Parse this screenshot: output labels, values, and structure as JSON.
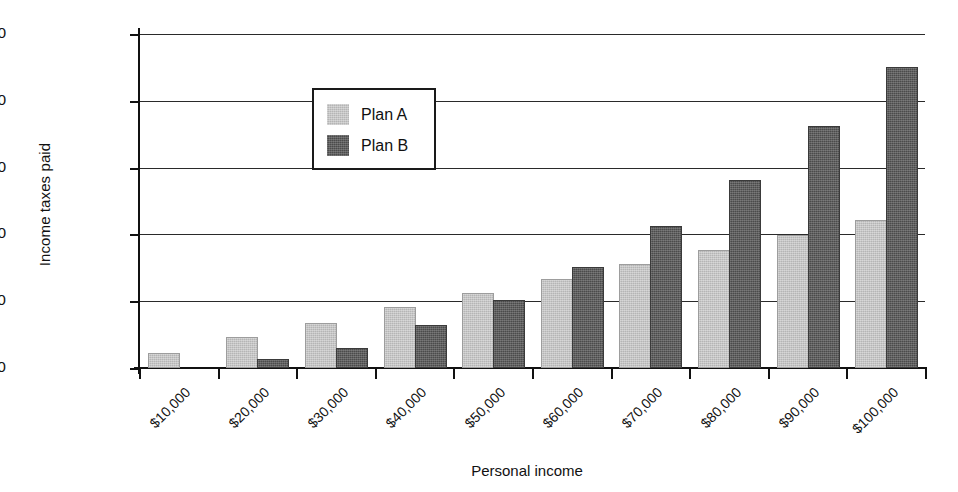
{
  "chart_data": {
    "type": "bar",
    "title": "",
    "xlabel": "Personal income",
    "ylabel": "Income taxes paid",
    "categories": [
      "$10,000",
      "$20,000",
      "$30,000",
      "$40,000",
      "$50,000",
      "$60,000",
      "$70,000",
      "$80,000",
      "$90,000",
      "$100,000"
    ],
    "series": [
      {
        "name": "Plan A",
        "color": "#b5b5b5",
        "values": [
          1000,
          2200,
          3200,
          4450,
          5450,
          6500,
          7600,
          8700,
          9800,
          10950
        ]
      },
      {
        "name": "Plan B",
        "color": "#4b4b4b",
        "values": [
          0,
          550,
          1350,
          3050,
          4950,
          7400,
          10450,
          13950,
          17950,
          22400
        ]
      }
    ],
    "ylim": [
      0,
      25000
    ],
    "ytick_values": [
      0,
      5000,
      10000,
      15000,
      20000,
      25000
    ],
    "ytick_labels": [
      "$0",
      "$5,000",
      "$10,000",
      "$15,000",
      "$20,000",
      "$25,000"
    ],
    "grid": "horizontal",
    "legend_position": "upper-left-inside"
  },
  "legend": {
    "entries": [
      {
        "label": "Plan A"
      },
      {
        "label": "Plan B"
      }
    ]
  },
  "axes": {
    "y_title": "Income taxes paid",
    "x_title": "Personal income"
  }
}
